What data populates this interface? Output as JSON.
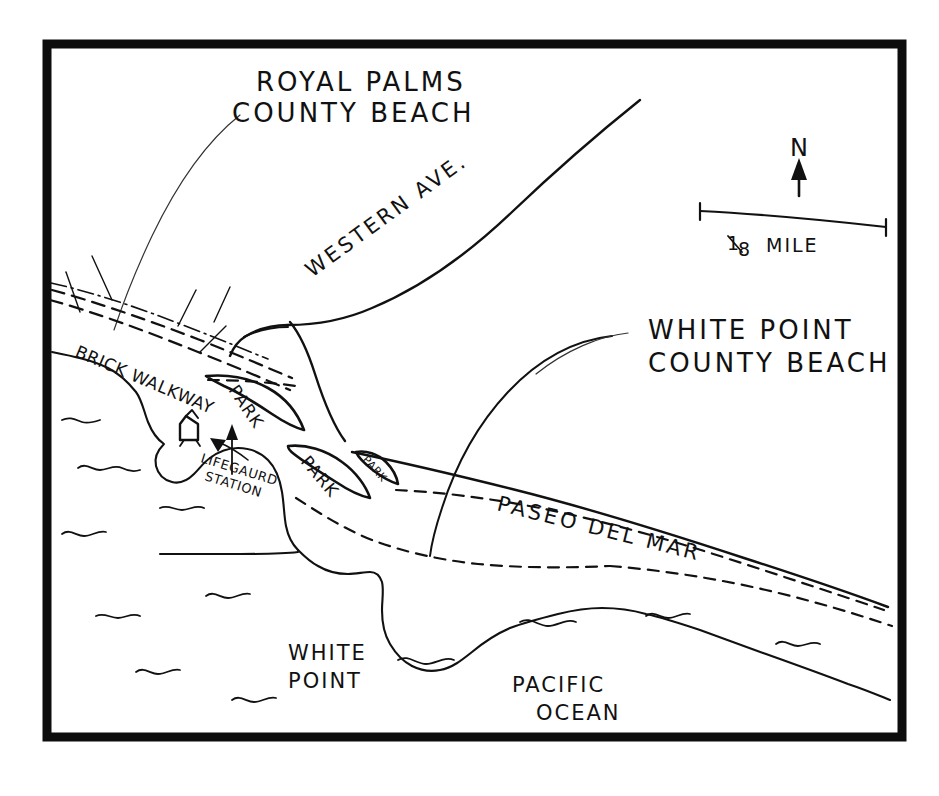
{
  "map": {
    "kind": "hand-drawn-location-map",
    "background_color": "#ffffff",
    "ink_color": "#111111",
    "frame_color": "#0d0d0d",
    "labels": {
      "royal_palms_line1": "ROYAL PALMS",
      "royal_palms_line2": "COUNTY BEACH",
      "white_point_beach_line1": "WHITE POINT",
      "white_point_beach_line2": "COUNTY BEACH",
      "western_ave": "WESTERN AVE.",
      "paseo_del_mar": "PASEO DEL MAR",
      "brick_walkway": "BRICK WALKWAY",
      "white_point_line1": "WHITE",
      "white_point_line2": "POINT",
      "pacific_ocean_line1": "PACIFIC",
      "pacific_ocean_line2": "OCEAN",
      "lifeguard_line1": "LIFEGAURD",
      "lifeguard_line2": "STATION",
      "park_1": "PARK",
      "park_2": "PARK",
      "park_3": "PARK"
    },
    "scale_bar": {
      "label": "1/8  MILE",
      "numerator": "1",
      "denominator": "8",
      "unit": "MILE"
    },
    "compass": {
      "label": "N",
      "direction": "up"
    },
    "symbols": {
      "lifeguard_station": "building-icon",
      "north_arrow": "north-arrow-icon",
      "wave": "wave-icon",
      "callout_arrow": "arrow-icon"
    }
  }
}
